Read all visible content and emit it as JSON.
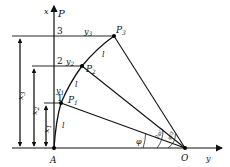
{
  "diagram": {
    "axis_x_label": "x",
    "axis_p_label": "P",
    "axis_y_label": "y",
    "origin_left": "A",
    "center": "O",
    "levels": [
      "1",
      "2",
      "3"
    ],
    "points": [
      "P1",
      "P2",
      "P3"
    ],
    "point_labels": {
      "p1": "P",
      "p1_sub": "1",
      "p2": "P",
      "p2_sub": "2",
      "p3": "P",
      "p3_sub": "3"
    },
    "y_labels": {
      "y1": "y",
      "y1_sub": "1",
      "y2": "y",
      "y2_sub": "2",
      "y3": "y",
      "y3_sub": "3"
    },
    "x_dims": {
      "x1": "x",
      "x1_sub": "1",
      "x2": "x",
      "x2_sub": "2",
      "x3": "x",
      "x3_sub": "3"
    },
    "arc_label": "l",
    "angles": {
      "phi": "φ",
      "two_thirds_phi": "2φ/3",
      "one_third_phi": "φ/3"
    }
  }
}
